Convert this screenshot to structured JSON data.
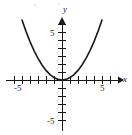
{
  "figure": {
    "background_color": "#ffffff",
    "ink_color": "#1a1a1a",
    "width_px": 132,
    "height_px": 135
  },
  "axes": {
    "x_axis_label": "x",
    "y_axis_label": "y",
    "origin_px": {
      "x": 62,
      "y": 80
    },
    "unit_px": 8,
    "x_label_negative": "-5",
    "x_label_positive": "5",
    "y_label_positive": "5",
    "y_label_negative": "-5",
    "x_tick_values": [
      -6,
      -5,
      -4,
      -3,
      -2,
      -1,
      1,
      2,
      3,
      4,
      5,
      6
    ],
    "y_tick_values": [
      -5,
      -4,
      -3,
      -2,
      -1,
      1,
      2,
      3,
      4,
      5,
      6,
      7
    ],
    "x_axis_start_px": 6,
    "x_axis_end_px": 120,
    "y_axis_top_px": 18,
    "y_axis_bottom_px": 131,
    "arrowheads": [
      "x-positive",
      "y-positive"
    ]
  },
  "chart_data": {
    "type": "line",
    "title": "",
    "xlabel": "x",
    "ylabel": "y",
    "xlim": [
      -7,
      7
    ],
    "ylim": [
      -6.5,
      7
    ],
    "grid": false,
    "legend": null,
    "x_ticks": [
      -5,
      5
    ],
    "y_ticks": [
      -5,
      5
    ],
    "x_tick_labels": [
      "-5",
      "5"
    ],
    "y_tick_labels": [
      "-5",
      "5"
    ],
    "tick_interval": 1,
    "series": [
      {
        "name": "parabola",
        "equation": "y = 0.3 x^2",
        "color": "#1a1a1a",
        "line_width": 1.6,
        "vertex": [
          0,
          0
        ],
        "opens": "up",
        "x": [
          -5.0,
          -4.5,
          -4.0,
          -3.5,
          -3.0,
          -2.5,
          -2.0,
          -1.5,
          -1.0,
          -0.5,
          0.0,
          0.5,
          1.0,
          1.5,
          2.0,
          2.5,
          3.0,
          3.5,
          4.0,
          4.5,
          5.0
        ],
        "y": [
          7.5,
          6.08,
          4.8,
          3.68,
          2.7,
          1.88,
          1.2,
          0.68,
          0.3,
          0.08,
          0.0,
          0.08,
          0.3,
          0.68,
          1.2,
          1.88,
          2.7,
          3.68,
          4.8,
          6.08,
          7.5
        ]
      }
    ]
  },
  "artifacts": {
    "specks": [
      {
        "x": 34,
        "y": 4,
        "size": 2
      },
      {
        "x": 37,
        "y": 6,
        "size": 1
      },
      {
        "x": 58,
        "y": 3,
        "size": 2
      },
      {
        "x": 60,
        "y": 6,
        "size": 1
      }
    ]
  }
}
